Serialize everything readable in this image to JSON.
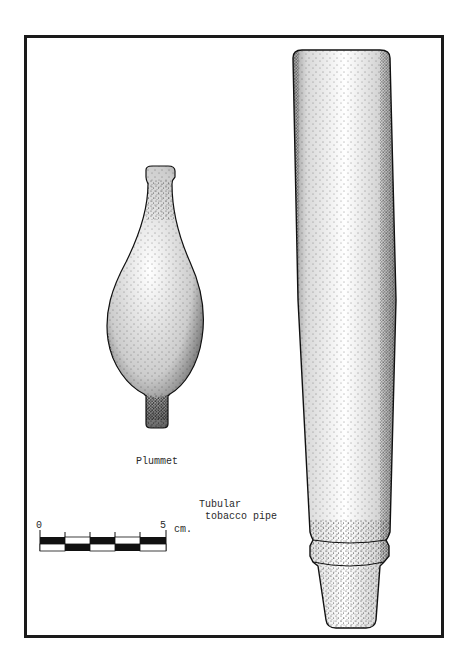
{
  "figure": {
    "labels": {
      "plummet": "Plummet",
      "pipe_line1": "Tubular",
      "pipe_line2": "tobacco pipe"
    },
    "scale_bar": {
      "start": "0",
      "end": "5",
      "unit": "cm.",
      "segments": 5,
      "top_row": [
        "black",
        "white",
        "black",
        "white",
        "black"
      ],
      "bottom_row": [
        "white",
        "black",
        "white",
        "black",
        "white"
      ]
    },
    "artifacts": [
      {
        "name": "Plummet",
        "type": "stippled-illustration"
      },
      {
        "name": "Tubular tobacco pipe",
        "type": "stippled-illustration"
      }
    ],
    "colors": {
      "ink": "#1a1a1a",
      "paper": "#ffffff"
    }
  }
}
